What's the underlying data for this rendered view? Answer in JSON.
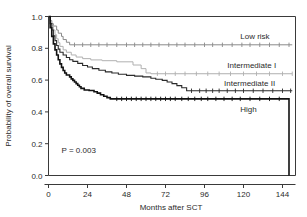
{
  "chart_data": {
    "type": "line",
    "title": "",
    "subtitle": "",
    "xlabel": "Months after SCT",
    "ylabel": "Probability of overall survival",
    "xlim": [
      0,
      152
    ],
    "ylim": [
      0,
      1.0
    ],
    "xticks": [
      0,
      24,
      48,
      72,
      96,
      120,
      144
    ],
    "xticklabels": [
      "0",
      "24",
      "48",
      "72",
      "96",
      "120",
      "144"
    ],
    "yticks": [
      0.0,
      0.2,
      0.4,
      0.6,
      0.8,
      1.0
    ],
    "yticklabels": [
      "0.0",
      "0.2",
      "0.4",
      "0.6",
      "0.8",
      "1.0"
    ],
    "grid": false,
    "legend_position": "inline-right",
    "annotations": [
      {
        "name": "p-value",
        "text": "P = 0.003",
        "x": 8,
        "y": 0.14
      }
    ],
    "series": [
      {
        "name": "Low risk",
        "label": "Low risk",
        "color": "#8a8a8a",
        "width": 1.0,
        "label_x": 118,
        "label_y": 0.875,
        "points": [
          [
            0,
            1.0
          ],
          [
            1,
            1.0
          ],
          [
            1,
            0.975
          ],
          [
            2,
            0.975
          ],
          [
            2,
            0.955
          ],
          [
            3,
            0.955
          ],
          [
            3,
            0.94
          ],
          [
            5,
            0.94
          ],
          [
            5,
            0.915
          ],
          [
            6,
            0.915
          ],
          [
            6,
            0.895
          ],
          [
            8,
            0.895
          ],
          [
            8,
            0.875
          ],
          [
            9,
            0.875
          ],
          [
            9,
            0.855
          ],
          [
            11,
            0.855
          ],
          [
            11,
            0.838
          ],
          [
            13,
            0.838
          ],
          [
            13,
            0.822
          ],
          [
            150,
            0.822
          ]
        ],
        "censor_x": [
          16,
          21,
          26,
          31,
          36,
          42,
          48,
          53,
          58,
          63,
          68,
          74,
          79,
          84,
          90,
          96,
          101,
          107,
          113,
          119,
          124,
          130,
          136,
          142,
          148
        ],
        "censor_y": 0.822
      },
      {
        "name": "Intermediate I",
        "label": "Intermediate I",
        "color": "#b0b0b0",
        "width": 1.0,
        "label_x": 110,
        "label_y": 0.695,
        "points": [
          [
            0,
            1.0
          ],
          [
            1,
            1.0
          ],
          [
            1,
            0.97
          ],
          [
            2,
            0.97
          ],
          [
            2,
            0.945
          ],
          [
            3,
            0.945
          ],
          [
            3,
            0.915
          ],
          [
            4,
            0.915
          ],
          [
            4,
            0.885
          ],
          [
            5,
            0.885
          ],
          [
            5,
            0.86
          ],
          [
            6,
            0.86
          ],
          [
            6,
            0.835
          ],
          [
            7,
            0.835
          ],
          [
            7,
            0.812
          ],
          [
            9,
            0.812
          ],
          [
            9,
            0.79
          ],
          [
            11,
            0.79
          ],
          [
            11,
            0.775
          ],
          [
            14,
            0.775
          ],
          [
            14,
            0.758
          ],
          [
            17,
            0.758
          ],
          [
            17,
            0.745
          ],
          [
            21,
            0.745
          ],
          [
            21,
            0.735
          ],
          [
            26,
            0.735
          ],
          [
            26,
            0.727
          ],
          [
            33,
            0.727
          ],
          [
            33,
            0.722
          ],
          [
            42,
            0.722
          ],
          [
            42,
            0.715
          ],
          [
            52,
            0.715
          ],
          [
            52,
            0.695
          ],
          [
            57,
            0.695
          ],
          [
            57,
            0.672
          ],
          [
            60,
            0.672
          ],
          [
            60,
            0.645
          ],
          [
            63,
            0.645
          ],
          [
            63,
            0.64
          ],
          [
            150,
            0.64
          ]
        ],
        "censor_x": [
          67,
          72,
          78,
          84,
          91,
          98,
          105,
          112,
          120,
          128,
          136,
          144,
          150
        ],
        "censor_y": 0.64
      },
      {
        "name": "Intermediate II",
        "label": "Intermediate II",
        "color": "#2b2b2b",
        "width": 1.1,
        "label_x": 108,
        "label_y": 0.583,
        "points": [
          [
            0,
            1.0
          ],
          [
            1,
            1.0
          ],
          [
            1,
            0.955
          ],
          [
            2,
            0.955
          ],
          [
            2,
            0.915
          ],
          [
            3,
            0.915
          ],
          [
            3,
            0.878
          ],
          [
            4,
            0.878
          ],
          [
            4,
            0.848
          ],
          [
            5,
            0.848
          ],
          [
            5,
            0.818
          ],
          [
            6,
            0.818
          ],
          [
            6,
            0.795
          ],
          [
            7,
            0.795
          ],
          [
            7,
            0.775
          ],
          [
            9,
            0.775
          ],
          [
            9,
            0.758
          ],
          [
            11,
            0.758
          ],
          [
            11,
            0.742
          ],
          [
            13,
            0.742
          ],
          [
            13,
            0.728
          ],
          [
            15,
            0.728
          ],
          [
            15,
            0.718
          ],
          [
            18,
            0.718
          ],
          [
            18,
            0.705
          ],
          [
            21,
            0.705
          ],
          [
            21,
            0.692
          ],
          [
            24,
            0.692
          ],
          [
            24,
            0.682
          ],
          [
            27,
            0.682
          ],
          [
            27,
            0.672
          ],
          [
            31,
            0.672
          ],
          [
            31,
            0.662
          ],
          [
            35,
            0.662
          ],
          [
            35,
            0.652
          ],
          [
            39,
            0.652
          ],
          [
            39,
            0.645
          ],
          [
            43,
            0.645
          ],
          [
            43,
            0.637
          ],
          [
            48,
            0.637
          ],
          [
            48,
            0.63
          ],
          [
            53,
            0.63
          ],
          [
            53,
            0.625
          ],
          [
            58,
            0.625
          ],
          [
            58,
            0.62
          ],
          [
            63,
            0.62
          ],
          [
            63,
            0.612
          ],
          [
            66,
            0.612
          ],
          [
            66,
            0.605
          ],
          [
            70,
            0.605
          ],
          [
            70,
            0.598
          ],
          [
            73,
            0.598
          ],
          [
            73,
            0.588
          ],
          [
            76,
            0.588
          ],
          [
            76,
            0.578
          ],
          [
            79,
            0.578
          ],
          [
            79,
            0.565
          ],
          [
            82,
            0.565
          ],
          [
            82,
            0.552
          ],
          [
            85,
            0.552
          ],
          [
            85,
            0.533
          ],
          [
            150,
            0.533
          ]
        ],
        "censor_x": [
          88,
          93,
          97,
          101,
          105,
          110,
          115,
          120,
          126,
          132,
          138,
          144,
          149
        ],
        "censor_y": 0.533
      },
      {
        "name": "High",
        "label": "High",
        "color": "#111111",
        "width": 1.6,
        "label_x": 118,
        "label_y": 0.42,
        "points": [
          [
            0,
            1.0
          ],
          [
            1,
            1.0
          ],
          [
            1,
            0.93
          ],
          [
            2,
            0.93
          ],
          [
            2,
            0.875
          ],
          [
            3,
            0.875
          ],
          [
            3,
            0.828
          ],
          [
            4,
            0.828
          ],
          [
            4,
            0.79
          ],
          [
            5,
            0.79
          ],
          [
            5,
            0.758
          ],
          [
            6,
            0.758
          ],
          [
            6,
            0.728
          ],
          [
            7,
            0.728
          ],
          [
            7,
            0.702
          ],
          [
            8,
            0.702
          ],
          [
            8,
            0.68
          ],
          [
            9,
            0.68
          ],
          [
            9,
            0.66
          ],
          [
            10,
            0.66
          ],
          [
            10,
            0.645
          ],
          [
            11,
            0.645
          ],
          [
            11,
            0.632
          ],
          [
            13,
            0.632
          ],
          [
            13,
            0.62
          ],
          [
            14,
            0.62
          ],
          [
            14,
            0.608
          ],
          [
            15,
            0.608
          ],
          [
            15,
            0.598
          ],
          [
            16,
            0.598
          ],
          [
            16,
            0.588
          ],
          [
            17,
            0.588
          ],
          [
            17,
            0.578
          ],
          [
            18,
            0.578
          ],
          [
            18,
            0.568
          ],
          [
            19,
            0.568
          ],
          [
            19,
            0.558
          ],
          [
            20,
            0.558
          ],
          [
            20,
            0.548
          ],
          [
            22,
            0.548
          ],
          [
            22,
            0.538
          ],
          [
            25,
            0.538
          ],
          [
            25,
            0.535
          ],
          [
            28,
            0.535
          ],
          [
            28,
            0.527
          ],
          [
            30,
            0.527
          ],
          [
            30,
            0.518
          ],
          [
            32,
            0.518
          ],
          [
            32,
            0.508
          ],
          [
            34,
            0.508
          ],
          [
            34,
            0.498
          ],
          [
            36,
            0.498
          ],
          [
            36,
            0.49
          ],
          [
            38,
            0.49
          ],
          [
            38,
            0.482
          ],
          [
            148,
            0.482
          ],
          [
            148,
            0.0
          ]
        ],
        "censor_x": [
          42,
          45,
          48,
          51,
          54,
          57,
          60,
          63,
          66,
          69,
          72,
          75,
          78,
          82,
          86,
          90,
          94,
          98,
          103,
          108,
          113,
          118,
          124,
          130,
          136,
          142
        ],
        "censor_y": 0.482
      }
    ]
  }
}
